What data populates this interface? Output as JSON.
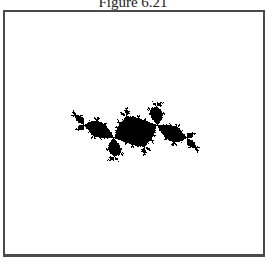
{
  "figure": {
    "title": "Figure 6.21",
    "colors": {
      "fill": "#000000",
      "background": "#ffffff",
      "frame": "#4a4a4a"
    },
    "fractal": {
      "type": "julia",
      "c_re": -0.12,
      "c_im": 0.75,
      "max_iter": 60,
      "bbox_px": {
        "x0": 48,
        "y0": 64,
        "x1": 222,
        "y1": 198
      }
    }
  }
}
